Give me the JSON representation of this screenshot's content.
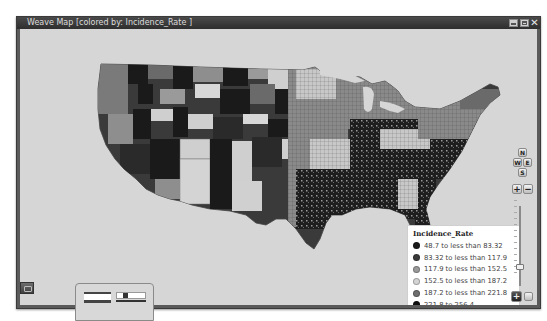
{
  "window": {
    "title": "Weave Map [colored by: Incidence_Rate ]",
    "controls": {
      "minimize": "minimize",
      "maximize": "maximize",
      "close": "✕"
    }
  },
  "map": {
    "region": "Continental United States (counties)",
    "background_color": "#d6d6d6",
    "colors": [
      "#1a1a1a",
      "#3a3a3a",
      "#8e8e8e",
      "#cfcfcf",
      "#6a6a6a",
      "#0d0d0d"
    ]
  },
  "legend": {
    "title": "Incidence_Rate",
    "items": [
      {
        "label": "48.7 to less than 83.32",
        "color": "#1a1a1a"
      },
      {
        "label": "83.32 to less than 117.9",
        "color": "#3a3a3a"
      },
      {
        "label": "117.9 to less than 152.5",
        "color": "#9a9a9a"
      },
      {
        "label": "152.5 to less than 187.2",
        "color": "#d4d4d4"
      },
      {
        "label": "187.2 to less than 221.8",
        "color": "#6e6e6e"
      },
      {
        "label": "221.8 to 256.4",
        "color": "#111111"
      }
    ]
  },
  "navigation": {
    "north": "N",
    "west": "W",
    "east": "E",
    "south": "S",
    "zoom_in": "+",
    "zoom_out": "−",
    "zoom_to_extent": "+"
  }
}
